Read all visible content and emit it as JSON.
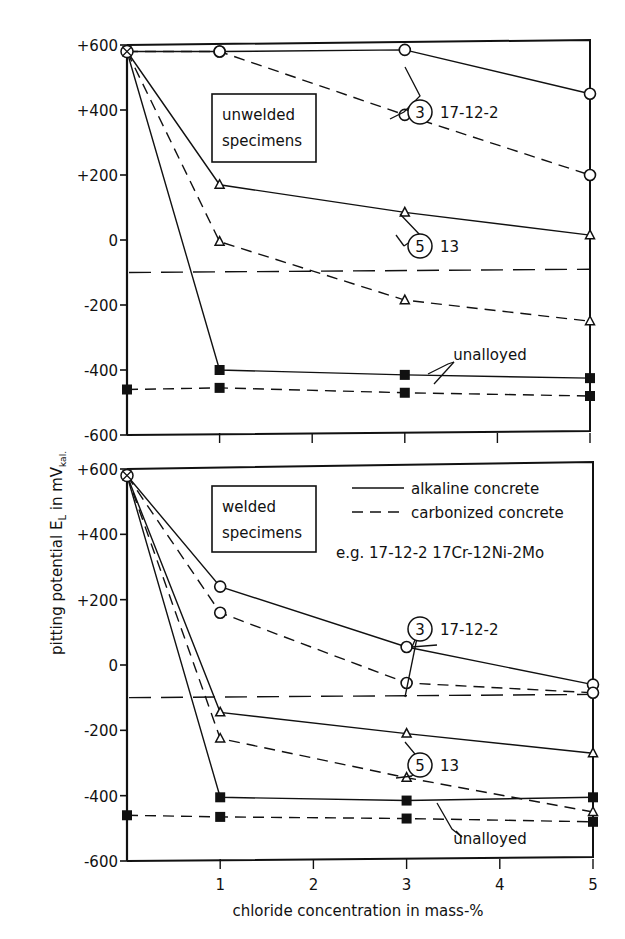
{
  "chart_data": [
    {
      "type": "line",
      "title": "unwelded specimens",
      "panel_label": [
        "unwelded",
        "specimens"
      ],
      "xlabel": "chloride concentration in mass-%",
      "ylabel": "pitting potential E_L in mV_kal.",
      "ylim": [
        -600,
        600
      ],
      "xlim": [
        0,
        5
      ],
      "yticks": [
        "+600",
        "+400",
        "+200",
        "0",
        "-200",
        "-400",
        "-600"
      ],
      "ytick_values": [
        600,
        400,
        200,
        0,
        -200,
        -400,
        -600
      ],
      "xticks": [
        "1",
        "2",
        "3",
        "4",
        "5"
      ],
      "xtick_values": [
        1,
        2,
        3,
        4,
        5
      ],
      "series": [
        {
          "name": "17-12-2 alkaline concrete",
          "group": "3",
          "style": "solid",
          "marker": "circle",
          "x": [
            0,
            1,
            3,
            5
          ],
          "y": [
            580,
            580,
            585,
            450
          ]
        },
        {
          "name": "17-12-2 carbonized concrete",
          "group": "3",
          "style": "dashed",
          "marker": "circle",
          "x": [
            0,
            1,
            3,
            5
          ],
          "y": [
            580,
            580,
            385,
            200
          ]
        },
        {
          "name": "13 alkaline concrete",
          "group": "5",
          "style": "solid",
          "marker": "triangle",
          "x": [
            0,
            1,
            3,
            5
          ],
          "y": [
            580,
            170,
            85,
            15
          ]
        },
        {
          "name": "13 carbonized concrete",
          "group": "5",
          "style": "dashed",
          "marker": "triangle",
          "x": [
            0,
            1,
            3,
            5
          ],
          "y": [
            580,
            -5,
            -185,
            -250
          ]
        },
        {
          "name": "unalloyed alkaline concrete",
          "group": "unalloyed",
          "style": "solid",
          "marker": "square",
          "x": [
            0,
            1,
            3,
            5
          ],
          "y": [
            580,
            -400,
            -415,
            -425
          ]
        },
        {
          "name": "unalloyed carbonized concrete",
          "group": "unalloyed",
          "style": "dashed",
          "marker": "square",
          "x": [
            0,
            1,
            3,
            5
          ],
          "y": [
            -460,
            -455,
            -470,
            -480
          ]
        }
      ],
      "reference_line": {
        "style": "long-dash",
        "x": [
          0,
          5
        ],
        "y": [
          -100,
          -90
        ]
      },
      "annotations": [
        {
          "circled": "3",
          "text": "17-12-2"
        },
        {
          "circled": "5",
          "text": "13"
        },
        {
          "circled": "",
          "text": "unalloyed"
        }
      ]
    },
    {
      "type": "line",
      "title": "welded specimens",
      "panel_label": [
        "welded",
        "specimens"
      ],
      "xlabel": "chloride concentration in mass-%",
      "ylabel": "pitting potential E_L in mV_kal.",
      "ylim": [
        -600,
        600
      ],
      "xlim": [
        0,
        5
      ],
      "yticks": [
        "+600",
        "+400",
        "+200",
        "0",
        "-200",
        "-400",
        "-600"
      ],
      "ytick_values": [
        600,
        400,
        200,
        0,
        -200,
        -400,
        -600
      ],
      "xticks": [
        "1",
        "2",
        "3",
        "4",
        "5"
      ],
      "xtick_values": [
        1,
        2,
        3,
        4,
        5
      ],
      "series": [
        {
          "name": "17-12-2 alkaline concrete",
          "group": "3",
          "style": "solid",
          "marker": "circle",
          "x": [
            0,
            1,
            3,
            5
          ],
          "y": [
            580,
            240,
            55,
            -60
          ]
        },
        {
          "name": "17-12-2 carbonized concrete",
          "group": "3",
          "style": "dashed",
          "marker": "circle",
          "x": [
            0,
            1,
            3,
            5
          ],
          "y": [
            580,
            160,
            -55,
            -85
          ]
        },
        {
          "name": "13 alkaline concrete",
          "group": "5",
          "style": "solid",
          "marker": "triangle",
          "x": [
            0,
            1,
            3,
            5
          ],
          "y": [
            580,
            -145,
            -210,
            -270
          ]
        },
        {
          "name": "13 carbonized concrete",
          "group": "5",
          "style": "dashed",
          "marker": "triangle",
          "x": [
            0,
            1,
            3,
            5
          ],
          "y": [
            580,
            -225,
            -345,
            -450
          ]
        },
        {
          "name": "unalloyed alkaline concrete",
          "group": "unalloyed",
          "style": "solid",
          "marker": "square",
          "x": [
            0,
            1,
            3,
            5
          ],
          "y": [
            580,
            -405,
            -415,
            -405
          ]
        },
        {
          "name": "unalloyed carbonized concrete",
          "group": "unalloyed",
          "style": "dashed",
          "marker": "square",
          "x": [
            0,
            1,
            3,
            5
          ],
          "y": [
            -460,
            -465,
            -470,
            -480
          ]
        }
      ],
      "reference_line": {
        "style": "long-dash",
        "x": [
          0,
          5
        ],
        "y": [
          -100,
          -90
        ]
      },
      "legend": {
        "placement": "top-right",
        "entries": [
          {
            "style": "solid",
            "label": "alkaline concrete"
          },
          {
            "style": "dashed",
            "label": "carbonized concrete"
          }
        ],
        "note": "e.g. 17-12-2   17Cr-12Ni-2Mo"
      },
      "annotations": [
        {
          "circled": "3",
          "text": "17-12-2"
        },
        {
          "circled": "5",
          "text": "13"
        },
        {
          "circled": "",
          "text": "unalloyed"
        }
      ]
    }
  ],
  "labels": {
    "xlabel": "chloride concentration in mass-%",
    "ylabel_main": "pitting potential E",
    "ylabel_sub": "L",
    "ylabel_unit": " in mV",
    "ylabel_unit_sub": "kal."
  }
}
